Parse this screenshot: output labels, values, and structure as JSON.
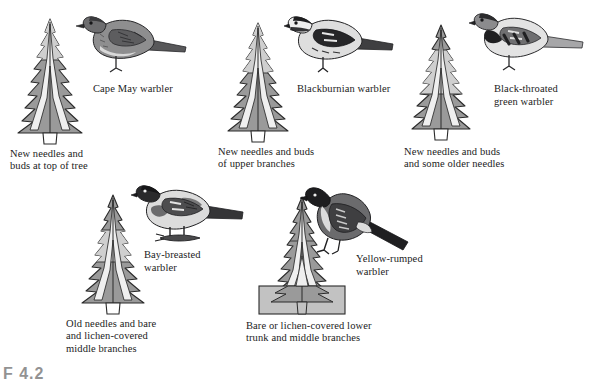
{
  "figure": {
    "number": "F 4.2",
    "background_color": "#ffffff",
    "palette": {
      "foliage": "#9a9a9a",
      "foliage_highlight": "#c8c8c8",
      "trunk_light": "#efefef",
      "outline": "#2b2b2b",
      "band_line": "#3a3a3a",
      "text": "#1b1b1b"
    }
  },
  "panels": [
    {
      "id": "cape-may",
      "bird_name": "Cape May warbler",
      "zone_caption": "New needles and\nbuds at top of tree",
      "zone": "top",
      "zone_band": {
        "top_fraction": 0.0,
        "bottom_fraction": 0.33
      },
      "bird_plumage": "streaked-olive",
      "tree_x": 12,
      "tree_y": 18,
      "tree_w": 76,
      "tree_h": 128,
      "caption_x": 10,
      "caption_y": 148,
      "bird_x": 76,
      "bird_y": 6,
      "bird_w": 112,
      "bird_h": 72,
      "label_x": 93,
      "label_y": 82
    },
    {
      "id": "blackburnian",
      "bird_name": "Blackburnian warbler",
      "zone_caption": "New needles and buds\nof upper branches",
      "zone": "upper",
      "zone_band": {
        "top_fraction": 0.0,
        "bottom_fraction": 0.42
      },
      "bird_plumage": "black-and-white-bold",
      "tree_x": 222,
      "tree_y": 22,
      "tree_w": 72,
      "tree_h": 122,
      "caption_x": 218,
      "caption_y": 146,
      "bird_x": 282,
      "bird_y": 8,
      "bird_w": 112,
      "bird_h": 70,
      "label_x": 297,
      "label_y": 82
    },
    {
      "id": "black-throated-green",
      "bird_name": "Black-throated\ngreen warbler",
      "zone_caption": "New needles and buds\nand some older needles",
      "zone": "upper-middle",
      "zone_band": {
        "top_fraction": 0.26,
        "bottom_fraction": 0.62
      },
      "bird_plumage": "black-throat-streaked",
      "tree_x": 406,
      "tree_y": 24,
      "tree_w": 70,
      "tree_h": 118,
      "caption_x": 404,
      "caption_y": 146,
      "bird_x": 466,
      "bird_y": 4,
      "bird_w": 118,
      "bird_h": 72,
      "label_x": 494,
      "label_y": 82
    },
    {
      "id": "bay-breasted",
      "bird_name": "Bay-breasted\nwarbler",
      "zone_caption": "Old needles and bare\nand lichen-covered\nmiddle branches",
      "zone": "middle",
      "zone_band": {
        "top_fraction": 0.34,
        "bottom_fraction": 0.62
      },
      "bird_plumage": "dark-cap-chestnut",
      "tree_x": 76,
      "tree_y": 194,
      "tree_w": 74,
      "tree_h": 122,
      "caption_x": 66,
      "caption_y": 318,
      "bird_x": 126,
      "bird_y": 176,
      "bird_w": 118,
      "bird_h": 72,
      "label_x": 144,
      "label_y": 248
    },
    {
      "id": "yellow-rumped",
      "bird_name": "Yellow-rumped\nwarbler",
      "zone_caption": "Bare or lichen-covered lower\ntrunk and middle branches",
      "zone": "lower-trunk",
      "zone_band": {
        "top_fraction": 0.62,
        "bottom_fraction": 1.0
      },
      "bird_plumage": "dark-slate-white-flank",
      "tree_x": 256,
      "tree_y": 196,
      "tree_w": 92,
      "tree_h": 122,
      "caption_x": 246,
      "caption_y": 320,
      "bird_x": 296,
      "bird_y": 182,
      "bird_w": 116,
      "bird_h": 76,
      "label_x": 356,
      "label_y": 252
    }
  ]
}
